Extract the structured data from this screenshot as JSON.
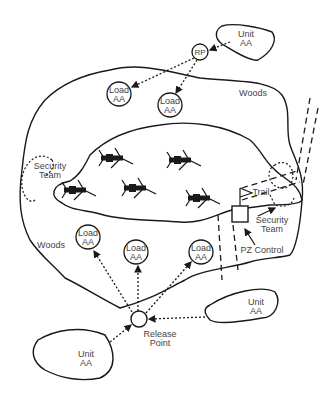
{
  "diagram": {
    "type": "pickup-zone layout",
    "colors": {
      "line": "#1a1a1a",
      "text": "#444444",
      "background": "#ffffff"
    },
    "areas": [
      {
        "id": "woods",
        "label": "Woods"
      },
      {
        "id": "clearing",
        "label": ""
      }
    ],
    "labels": {
      "unit_top": "Unit\nAA",
      "rp": "RP",
      "load_1": "Load\nAA",
      "load_2": "Load\nAA",
      "woods_top": "Woods",
      "security_left": "Security\nTeam",
      "trail": "Trail",
      "security_right": "Security\nTeam",
      "pz_control": "PZ Control",
      "woods_left": "Woods",
      "load_3": "Load\nAA",
      "load_4": "Load\nAA",
      "load_5": "Load\nAA",
      "unit_right": "Unit\nAA",
      "release_point": "Release\nPoint",
      "unit_bottom": "Unit\nAA"
    },
    "aircraft_count": 5
  }
}
